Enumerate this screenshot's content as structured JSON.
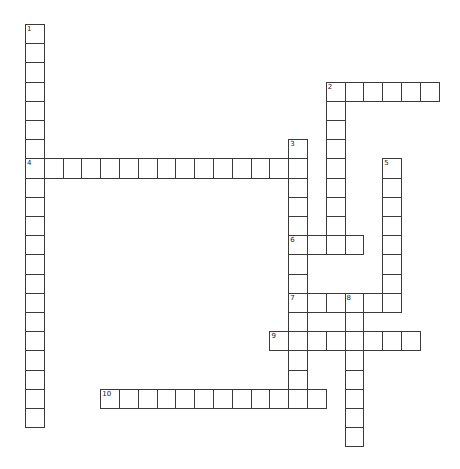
{
  "puzzle": {
    "grid": {
      "origin_x": 25,
      "origin_y": 24,
      "cell_width": 18.8,
      "cell_height": 19.2,
      "border_color": "#3a3a3a",
      "background": "#ffffff"
    },
    "entries": [
      {
        "number": "1",
        "direction": "down",
        "row": 0,
        "col": 0,
        "length": 21
      },
      {
        "number": "2",
        "direction": "across",
        "row": 3,
        "col": 16,
        "length": 6
      },
      {
        "number": "2",
        "direction": "down",
        "row": 3,
        "col": 16,
        "length": 9
      },
      {
        "number": "3",
        "direction": "down",
        "row": 6,
        "col": 14,
        "length": 14
      },
      {
        "number": "4",
        "direction": "across",
        "row": 7,
        "col": 0,
        "length": 15
      },
      {
        "number": "5",
        "direction": "down",
        "row": 7,
        "col": 19,
        "length": 8
      },
      {
        "number": "6",
        "direction": "across",
        "row": 11,
        "col": 14,
        "length": 4
      },
      {
        "number": "7",
        "direction": "across",
        "row": 14,
        "col": 14,
        "length": 6
      },
      {
        "number": "8",
        "direction": "down",
        "row": 14,
        "col": 17,
        "length": 8
      },
      {
        "number": "9",
        "direction": "across",
        "row": 16,
        "col": 13,
        "length": 8
      },
      {
        "number": "10",
        "direction": "across",
        "row": 19,
        "col": 4,
        "length": 12
      }
    ]
  }
}
